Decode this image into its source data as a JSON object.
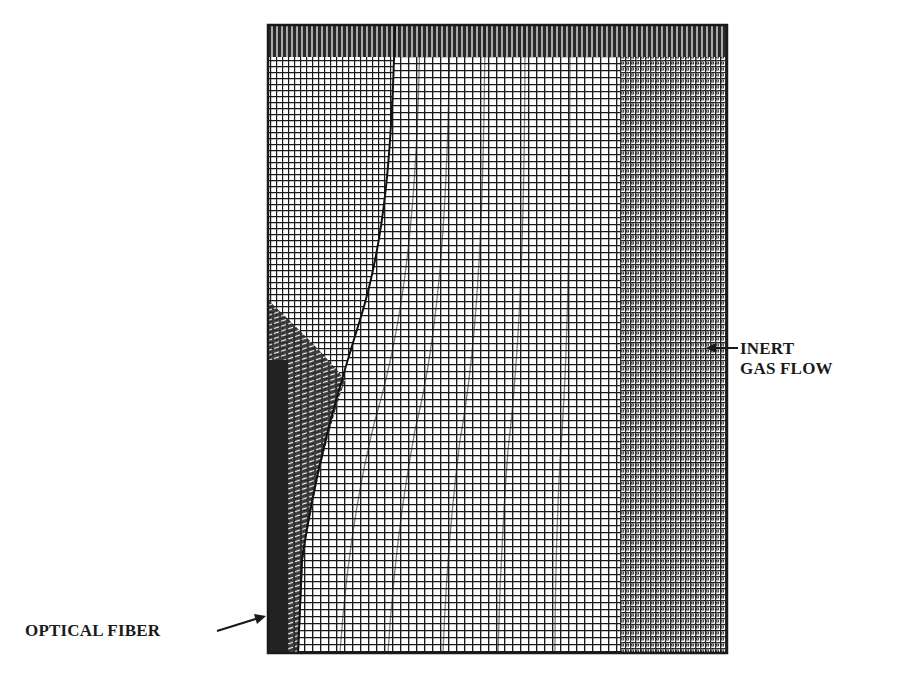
{
  "diagram": {
    "type": "computational-mesh",
    "frame": {
      "x": 268,
      "y": 25,
      "width": 459,
      "height": 628
    },
    "colors": {
      "ink": "#1a1a1a",
      "paper": "#ffffff",
      "fiber": "#222222"
    },
    "labels": {
      "inert_gas_flow_line1": "INERT",
      "inert_gas_flow_line2": "GAS FLOW",
      "optical_fiber": "OPTICAL FIBER"
    },
    "boundary_curve": {
      "description": "curved interface separating fiber-adjacent region from gas region",
      "points": [
        [
          395,
          25
        ],
        [
          390,
          150
        ],
        [
          378,
          260
        ],
        [
          340,
          380
        ],
        [
          315,
          470
        ],
        [
          302,
          560
        ],
        [
          298,
          653
        ]
      ]
    },
    "fiber_strip": {
      "x": 268,
      "y": 360,
      "width": 20,
      "height": 293
    }
  }
}
